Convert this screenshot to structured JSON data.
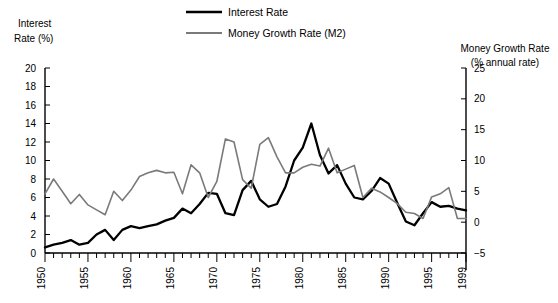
{
  "chart_data": {
    "type": "line",
    "title": "",
    "xlabel": "",
    "x": [
      1950,
      1951,
      1952,
      1953,
      1954,
      1955,
      1956,
      1957,
      1958,
      1959,
      1960,
      1961,
      1962,
      1963,
      1964,
      1965,
      1966,
      1967,
      1968,
      1969,
      1970,
      1971,
      1972,
      1973,
      1974,
      1975,
      1976,
      1977,
      1978,
      1979,
      1980,
      1981,
      1982,
      1983,
      1984,
      1985,
      1986,
      1987,
      1988,
      1989,
      1990,
      1991,
      1992,
      1993,
      1994,
      1995,
      1996,
      1997,
      1998,
      1999
    ],
    "xlim": [
      1950,
      1999
    ],
    "xticks": [
      1950,
      1955,
      1960,
      1965,
      1970,
      1975,
      1980,
      1985,
      1990,
      1995,
      1999
    ],
    "xticklabels": [
      "1950",
      "1955",
      "1960",
      "1965",
      "1970",
      "1975",
      "1980",
      "1985",
      "1990",
      "1995",
      "1999"
    ],
    "grid": false,
    "legend_position": "top-center",
    "axes": [
      {
        "id": "left",
        "label_line1": "Interest",
        "label_line2": "Rate (%)",
        "ylim": [
          0,
          20
        ],
        "yticks": [
          0,
          2,
          4,
          6,
          8,
          10,
          12,
          14,
          16,
          18,
          20
        ],
        "yticklabels": [
          "0",
          "2",
          "4",
          "6",
          "8",
          "10",
          "12",
          "14",
          "16",
          "18",
          "20"
        ]
      },
      {
        "id": "right",
        "label_line1": "Money Growth Rate",
        "label_line2": "(% annual rate)",
        "ylim": [
          -5,
          25
        ],
        "yticks": [
          -5,
          0,
          5,
          10,
          15,
          20,
          25
        ],
        "yticklabels": [
          "−5",
          "0",
          "5",
          "10",
          "15",
          "20",
          "25"
        ]
      }
    ],
    "series": [
      {
        "name": "Interest Rate",
        "legend_label": "Interest Rate",
        "axis": "left",
        "color": "#000000",
        "width": 2.3,
        "values": [
          0.6,
          0.9,
          1.1,
          1.4,
          0.9,
          1.1,
          2.0,
          2.5,
          1.4,
          2.5,
          2.9,
          2.7,
          2.9,
          3.1,
          3.5,
          3.8,
          4.8,
          4.3,
          5.3,
          6.5,
          6.4,
          4.3,
          4.1,
          6.8,
          7.8,
          5.8,
          5.0,
          5.3,
          7.2,
          10.0,
          11.4,
          14.0,
          10.6,
          8.6,
          9.5,
          7.5,
          6.0,
          5.8,
          6.7,
          8.1,
          7.5,
          5.4,
          3.4,
          3.0,
          4.3,
          5.5,
          5.0,
          5.1,
          4.8,
          4.6
        ],
        "notes": "3-month Treasury bill rate; peak 1981 ~14, 1980 spike ~17.5 shown as tallest black point"
      },
      {
        "name": "Money Growth Rate (M2)",
        "legend_label": "Money Growth Rate (M2)",
        "axis": "right",
        "color": "#7a7a7a",
        "width": 1.6,
        "values": [
          4.6,
          7.0,
          5.0,
          3.0,
          4.5,
          2.8,
          2.0,
          1.2,
          5.0,
          3.5,
          5.2,
          7.4,
          8.0,
          8.4,
          8.0,
          8.1,
          4.6,
          9.3,
          8.0,
          4.0,
          6.6,
          13.5,
          13.0,
          6.9,
          5.5,
          12.6,
          13.7,
          10.6,
          8.0,
          8.0,
          8.9,
          9.4,
          9.1,
          12.0,
          8.0,
          8.6,
          9.2,
          4.0,
          5.5,
          4.9,
          4.0,
          3.0,
          1.6,
          1.4,
          0.6,
          4.1,
          4.6,
          5.6,
          0.6,
          0.6
        ],
        "notes": "M2 annual growth rate plotted on right axis"
      }
    ]
  },
  "legend": {
    "items": [
      {
        "label": "Interest Rate",
        "color": "#000000"
      },
      {
        "label": "Money Growth Rate (M2)",
        "color": "#7a7a7a"
      }
    ]
  }
}
